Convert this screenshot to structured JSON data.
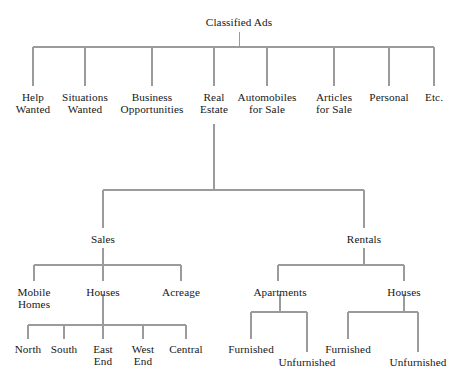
{
  "diagram": {
    "type": "tree",
    "title": "Classified Ads",
    "line_color": "#9b9b9b",
    "text_color": "#171717",
    "background_color": "#ffffff",
    "levels": 5
  },
  "nodes": {
    "root": {
      "label": "Classified Ads"
    },
    "level1": [
      {
        "label_l1": "Help",
        "label_l2": "Wanted"
      },
      {
        "label_l1": "Situations",
        "label_l2": "Wanted"
      },
      {
        "label_l1": "Business",
        "label_l2": "Opportunities"
      },
      {
        "label_l1": "Real",
        "label_l2": "Estate"
      },
      {
        "label_l1": "Automobiles",
        "label_l2": "for Sale"
      },
      {
        "label_l1": "Articles",
        "label_l2": "for Sale"
      },
      {
        "label_l1": "Personal",
        "label_l2": ""
      },
      {
        "label_l1": "Etc.",
        "label_l2": ""
      }
    ],
    "level2": [
      {
        "label": "Sales"
      },
      {
        "label": "Rentals"
      }
    ],
    "sales_children": [
      {
        "label_l1": "Mobile",
        "label_l2": "Homes"
      },
      {
        "label_l1": "Houses",
        "label_l2": ""
      },
      {
        "label_l1": "Acreage",
        "label_l2": ""
      }
    ],
    "houses_sale_children": [
      {
        "label_l1": "North",
        "label_l2": ""
      },
      {
        "label_l1": "South",
        "label_l2": ""
      },
      {
        "label_l1": "East",
        "label_l2": "End"
      },
      {
        "label_l1": "West",
        "label_l2": "End"
      },
      {
        "label_l1": "Central",
        "label_l2": ""
      }
    ],
    "rentals_children": [
      {
        "label": "Apartments"
      },
      {
        "label": "Houses"
      }
    ],
    "apartments_children": [
      {
        "label": "Furnished"
      },
      {
        "label": "Unfurnished"
      }
    ],
    "rental_houses_children": [
      {
        "label": "Furnished"
      },
      {
        "label": "Unfurnished"
      }
    ]
  }
}
